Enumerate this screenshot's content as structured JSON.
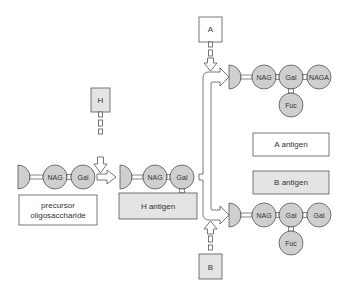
{
  "colors": {
    "sugar_fill": "#cfcfcf",
    "gray_box": "#e4e4e4",
    "white_box": "#ffffff",
    "stroke": "#555555",
    "text": "#333333"
  },
  "enzymes": {
    "h": "H",
    "a": "A",
    "b": "B"
  },
  "precursor_chain": {
    "nag": "NAG",
    "gal": "Gal"
  },
  "h_chain": {
    "nag": "NAG",
    "gal": "Gal",
    "fuc": "Fuc"
  },
  "a_chain": {
    "nag": "NAG",
    "gal": "Gal",
    "naga": "NAGA",
    "fuc": "Fuc"
  },
  "b_chain": {
    "nag": "NAG",
    "gal": "Gal",
    "gal2": "Gal",
    "fuc": "Fuc"
  },
  "legend": {
    "precursor_line1": "precursor",
    "precursor_line2": "oligosaccharide",
    "h_antigen": "H antigen",
    "a_antigen": "A antigen",
    "b_antigen": "B antigen"
  }
}
